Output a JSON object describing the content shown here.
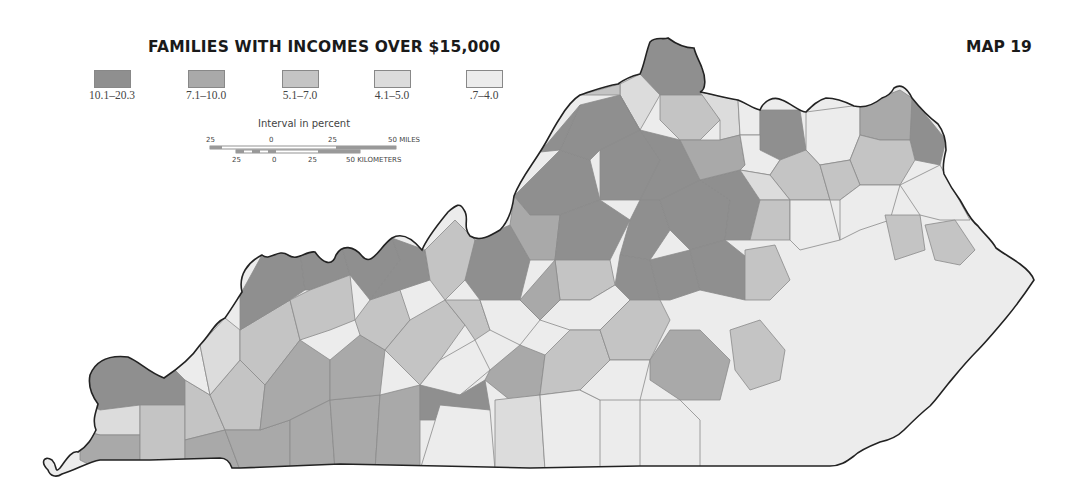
{
  "map": {
    "title": "FAMILIES WITH INCOMES OVER $15,000",
    "map_number": "MAP 19",
    "legend": {
      "caption": "Interval in percent",
      "classes": [
        {
          "label": "10.1–20.3",
          "color": "#8f8f8f"
        },
        {
          "label": "7.1–10.0",
          "color": "#a9a9a9"
        },
        {
          "label": "5.1–7.0",
          "color": "#c4c4c4"
        },
        {
          "label": "4.1–5.0",
          "color": "#dcdcdc"
        },
        {
          "label": ".7–4.0",
          "color": "#ececec"
        }
      ]
    },
    "scale": {
      "miles": {
        "left": "25",
        "zero": "0",
        "mid": "25",
        "right": "50 MILES"
      },
      "kilometers": {
        "left": "25",
        "zero": "0",
        "mid": "25",
        "right": "50 KILOMETERS"
      }
    },
    "region": "Kentucky (by county)"
  }
}
